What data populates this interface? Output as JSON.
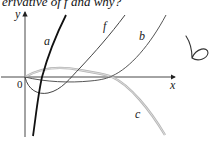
{
  "question": {
    "text": "erivative of f and why?",
    "marker": "(b)"
  },
  "diagram": {
    "type": "function-graphs",
    "axes": {
      "x_label": "x",
      "y_label": "y",
      "origin_label": "0"
    },
    "curves": [
      {
        "name": "a",
        "label": "a",
        "color": "#111111",
        "description": "steep increasing curve crossing x-axis near origin"
      },
      {
        "name": "f",
        "label": "f",
        "color": "#444444",
        "description": "dips below x-axis then rises"
      },
      {
        "name": "b",
        "label": "b",
        "color": "#555555",
        "description": "slightly below x-axis then rises steeply"
      },
      {
        "name": "c",
        "label": "c",
        "color": "#aaaaaa",
        "description": "small bump above x-axis then falls"
      }
    ],
    "handwritten_answer": "b"
  }
}
